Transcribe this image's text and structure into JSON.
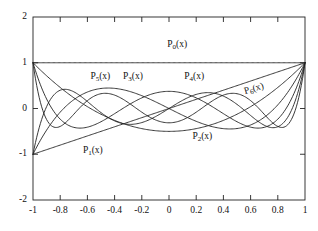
{
  "chart_data": {
    "type": "line",
    "title": "",
    "subtitle": "",
    "xlabel": "",
    "ylabel": "",
    "xlim": [
      -1,
      1
    ],
    "ylim": [
      -2,
      2
    ],
    "grid": false,
    "legend_position": "inline-curve-labels",
    "frame": "box",
    "tick_direction": "in",
    "xticks": [
      -1,
      -0.8,
      -0.6,
      -0.4,
      -0.2,
      0,
      0.2,
      0.4,
      0.6,
      0.8,
      1
    ],
    "xtick_labels": [
      "-1",
      "-0.8",
      "-0.6",
      "-0.4",
      "-0.2",
      "0",
      "0.2",
      "0.4",
      "0.6",
      "0.8",
      "1"
    ],
    "yticks": [
      -2,
      -1,
      0,
      1,
      2
    ],
    "ytick_labels": [
      "-2",
      "-1",
      "0",
      "1",
      "2"
    ],
    "line_color": "#222222",
    "line_width": 0.9,
    "series": [
      {
        "name": "P0(x)",
        "label": "P0(x)",
        "label_base": "P",
        "label_sub": "0",
        "label_tail": "(x)",
        "label_x": 0.06,
        "label_y": 1.38,
        "label_rotation": 0,
        "degree": 0,
        "x": [
          -1,
          -0.9,
          -0.8,
          -0.7,
          -0.6,
          -0.5,
          -0.4,
          -0.3,
          -0.2,
          -0.1,
          0,
          0.1,
          0.2,
          0.3,
          0.4,
          0.5,
          0.6,
          0.7,
          0.8,
          0.9,
          1
        ],
        "values": [
          1,
          1,
          1,
          1,
          1,
          1,
          1,
          1,
          1,
          1,
          1,
          1,
          1,
          1,
          1,
          1,
          1,
          1,
          1,
          1,
          1
        ]
      },
      {
        "name": "P1(x)",
        "label": "P1(x)",
        "label_base": "P",
        "label_sub": "1",
        "label_tail": "(x)",
        "label_x": -0.56,
        "label_y": -0.93,
        "label_rotation": 0,
        "degree": 1,
        "x": [
          -1,
          -0.9,
          -0.8,
          -0.7,
          -0.6,
          -0.5,
          -0.4,
          -0.3,
          -0.2,
          -0.1,
          0,
          0.1,
          0.2,
          0.3,
          0.4,
          0.5,
          0.6,
          0.7,
          0.8,
          0.9,
          1
        ],
        "values": [
          -1,
          -0.9,
          -0.8,
          -0.7,
          -0.6,
          -0.5,
          -0.4,
          -0.3,
          -0.2,
          -0.1,
          0,
          0.1,
          0.2,
          0.3,
          0.4,
          0.5,
          0.6,
          0.7,
          0.8,
          0.9,
          1
        ]
      },
      {
        "name": "P2(x)",
        "label": "P2(x)",
        "label_base": "P",
        "label_sub": "2",
        "label_tail": "(x)",
        "label_x": 0.245,
        "label_y": -0.62,
        "label_rotation": 0,
        "degree": 2,
        "x": [
          -1,
          -0.9,
          -0.8,
          -0.7,
          -0.6,
          -0.5,
          -0.4,
          -0.3,
          -0.2,
          -0.1,
          0,
          0.1,
          0.2,
          0.3,
          0.4,
          0.5,
          0.6,
          0.7,
          0.8,
          0.9,
          1
        ],
        "values": [
          1,
          0.715,
          0.46,
          0.235,
          0.04,
          -0.125,
          -0.26,
          -0.365,
          -0.44,
          -0.485,
          -0.5,
          -0.485,
          -0.44,
          -0.365,
          -0.26,
          -0.125,
          0.04,
          0.235,
          0.46,
          0.715,
          1
        ]
      },
      {
        "name": "P3(x)",
        "label": "P3(x)",
        "label_base": "P",
        "label_sub": "3",
        "label_tail": "(x)",
        "label_x": -0.265,
        "label_y": 0.695,
        "label_rotation": 0,
        "degree": 3,
        "x": [
          -1,
          -0.9,
          -0.8,
          -0.7,
          -0.6,
          -0.5,
          -0.4,
          -0.3,
          -0.2,
          -0.1,
          0,
          0.1,
          0.2,
          0.3,
          0.4,
          0.5,
          0.6,
          0.7,
          0.8,
          0.9,
          1
        ],
        "values": [
          -1,
          -0.4725,
          -0.08,
          0.1925,
          0.36,
          0.4375,
          0.44,
          0.3825,
          0.28,
          0.1475,
          0,
          -0.1475,
          -0.28,
          -0.3825,
          -0.44,
          -0.4375,
          -0.36,
          -0.1925,
          0.08,
          0.4725,
          1
        ]
      },
      {
        "name": "P4(x)",
        "label": "P4(x)",
        "label_base": "P",
        "label_sub": "4",
        "label_tail": "(x)",
        "label_x": 0.185,
        "label_y": 0.695,
        "label_rotation": 0,
        "degree": 4,
        "x": [
          -1,
          -0.9,
          -0.8,
          -0.7,
          -0.6,
          -0.5,
          -0.4,
          -0.3,
          -0.2,
          -0.1,
          0,
          0.1,
          0.2,
          0.3,
          0.4,
          0.5,
          0.6,
          0.7,
          0.8,
          0.9,
          1
        ],
        "values": [
          1,
          0.2079,
          -0.233,
          -0.4121,
          -0.408,
          -0.2891,
          -0.113,
          0.0729,
          0.232,
          0.3379,
          0.375,
          0.3379,
          0.232,
          0.0729,
          -0.113,
          -0.2891,
          -0.408,
          -0.4121,
          -0.233,
          0.2079,
          1
        ]
      },
      {
        "name": "P5(x)",
        "label": "P5(x)",
        "label_base": "P",
        "label_sub": "5",
        "label_tail": "(x)",
        "label_x": -0.505,
        "label_y": 0.695,
        "label_rotation": 0,
        "degree": 5,
        "x": [
          -1,
          -0.9,
          -0.8,
          -0.7,
          -0.6,
          -0.5,
          -0.4,
          -0.3,
          -0.2,
          -0.1,
          0,
          0.1,
          0.2,
          0.3,
          0.4,
          0.5,
          0.6,
          0.7,
          0.8,
          0.9,
          1
        ],
        "values": [
          -1,
          0.04075,
          0.3995,
          0.36475,
          0.1526,
          -0.08984,
          -0.27064,
          -0.36461,
          -0.37525,
          -0.29401,
          -0.1525,
          -1e-05,
          0.17,
          0.26461,
          0.27064,
          0.08984,
          -0.1526,
          -0.36475,
          -0.3995,
          -0.04075,
          1
        ]
      },
      {
        "name": "P6(x)",
        "label": "P6(x)",
        "label_base": "P",
        "label_sub": "6",
        "label_tail": "(x)",
        "label_x": 0.625,
        "label_y": 0.435,
        "label_rotation": -16,
        "degree": 6,
        "x": [
          -1,
          -0.9,
          -0.8,
          -0.7,
          -0.6,
          -0.5,
          -0.4,
          -0.3,
          -0.2,
          -0.1,
          0,
          0.1,
          0.2,
          0.3,
          0.4,
          0.5,
          0.6,
          0.7,
          0.8,
          0.9,
          1
        ],
        "values": [
          1,
          -0.1526,
          -0.2898,
          0.0671,
          0.3226,
          0.3232,
          0.1526,
          -0.0741,
          -0.2412,
          -0.3131,
          -0.3125,
          -0.2412,
          -0.0741,
          0.1526,
          0.3232,
          0.3226,
          0.0671,
          -0.2898,
          -0.1526,
          0.5702,
          1
        ]
      }
    ]
  },
  "axes": {
    "plot_left_px": 33,
    "plot_right_px": 305,
    "plot_top_px": 17,
    "plot_bottom_px": 200
  }
}
